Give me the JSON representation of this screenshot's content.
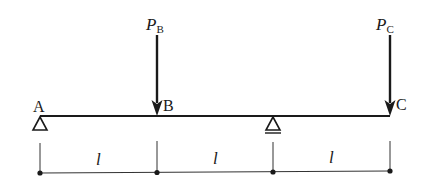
{
  "diagram": {
    "type": "beam",
    "beam": {
      "x_start": 40,
      "x_end": 390,
      "y": 116
    },
    "points": [
      {
        "id": "A",
        "label": "A",
        "x": 40
      },
      {
        "id": "B",
        "label": "B",
        "x": 157
      },
      {
        "id": "S",
        "label": "",
        "x": 273
      },
      {
        "id": "C",
        "label": "C",
        "x": 390
      }
    ],
    "supports": [
      {
        "at": "A",
        "kind": "pin"
      },
      {
        "at": "S",
        "kind": "roller"
      }
    ],
    "loads": [
      {
        "at": "B",
        "symbol": "P",
        "subscript": "B",
        "direction": "down"
      },
      {
        "at": "C",
        "symbol": "P",
        "subscript": "C",
        "direction": "down"
      }
    ],
    "dimensions": [
      {
        "from": "A",
        "to": "B",
        "label": "l"
      },
      {
        "from": "B",
        "to": "S",
        "label": "l"
      },
      {
        "from": "S",
        "to": "C",
        "label": "l"
      }
    ],
    "colors": {
      "stroke": "#1a1a1a",
      "background": "#ffffff"
    }
  }
}
